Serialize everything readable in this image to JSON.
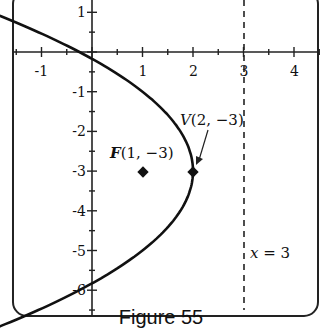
{
  "caption": "Figure 55",
  "chart_data": {
    "type": "line",
    "title": "",
    "caption": "Figure 55",
    "xlabel": "",
    "ylabel": "",
    "xlim": [
      -1.5,
      4.5
    ],
    "ylim": [
      -6.6,
      1.3
    ],
    "grid": false,
    "x_ticks": [
      -1,
      1,
      2,
      3,
      4
    ],
    "y_ticks": [
      1,
      -1,
      -2,
      -3,
      -4,
      -5,
      -6
    ],
    "x_tick_labels": [
      "-1",
      "1",
      "2",
      "3",
      "4"
    ],
    "y_tick_labels": [
      "1",
      "-1",
      "-2",
      "-3",
      "-4",
      "-5",
      "-6"
    ],
    "series": [
      {
        "name": "parabola",
        "equation": "(y+3)^2 = -4(x-2)",
        "style": "solid",
        "x": [
          -1.5,
          -1,
          -0.25,
          0,
          1,
          1.75,
          2,
          1.75,
          1,
          0,
          -0.25,
          -1,
          -1.5
        ],
        "y": [
          0.742,
          0.464,
          0,
          -0.172,
          -1,
          -2,
          -3,
          -4,
          -5,
          -5.828,
          -6,
          -6.464,
          -6.742
        ]
      },
      {
        "name": "directrix",
        "equation": "x = 3",
        "style": "dashed",
        "x": [
          3,
          3
        ],
        "y": [
          1.3,
          -6.6
        ]
      }
    ],
    "points": [
      {
        "name": "vertex",
        "label": "V(2, −3)",
        "x": 2,
        "y": -3
      },
      {
        "name": "focus",
        "label": "F(1, −3)",
        "x": 1,
        "y": -3
      }
    ],
    "annotations": [
      {
        "text": "V(2, −3)",
        "points_to": [
          2,
          -3
        ],
        "arrow": true
      },
      {
        "text": "F(1, −3)",
        "near": [
          1,
          -3
        ]
      },
      {
        "text": "x = 3",
        "near": [
          3,
          -5.5
        ]
      }
    ]
  },
  "labels": {
    "vertex_label_V": "V",
    "vertex_label_coords": "(2, −3)",
    "focus_label_F": "F",
    "focus_label_coords": "(1, −3)",
    "directrix_label_x": "x",
    "directrix_label_rest": " = 3"
  }
}
